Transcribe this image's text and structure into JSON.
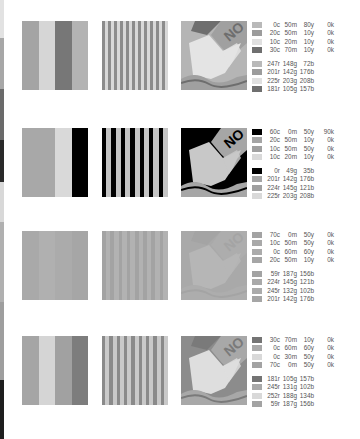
{
  "edge_strip": [
    {
      "top": 0,
      "height": 38,
      "color": "#e2e2e2"
    },
    {
      "top": 38,
      "height": 51,
      "color": "#a7a7a7"
    },
    {
      "top": 89,
      "height": 51,
      "color": "#6a6a6a"
    },
    {
      "top": 140,
      "height": 42,
      "color": "#2a2a2a"
    },
    {
      "top": 182,
      "height": 40,
      "color": "#d8d8d8"
    },
    {
      "top": 222,
      "height": 80,
      "color": "#b0b0b0"
    },
    {
      "top": 302,
      "height": 78,
      "color": "#9e9e9e"
    },
    {
      "top": 380,
      "height": 59,
      "color": "#1e1e1e"
    }
  ],
  "rows": [
    {
      "top": 21,
      "stripes": [
        "#a4a4a4",
        "#d6d6d6",
        "#777777",
        "#b3b3b3"
      ],
      "lines": {
        "a": "#8c8c8c",
        "b": "#d8d8d8",
        "count": 11
      },
      "art": {
        "bg": "#b5b5b5",
        "dark": "#6e6e6e",
        "light": "#e4e4e4",
        "mid": "#a0a0a0"
      },
      "swatches_cmyk": [
        "#b9b9b9",
        "#9c9c9c",
        "#e0e0e0",
        "#6f6f6f"
      ],
      "swatches_rgb": [
        "#b9b9b9",
        "#9c9c9c",
        "#e0e0e0",
        "#6f6f6f"
      ],
      "cmyk": [
        [
          "0c",
          "50m",
          "80y",
          "0k"
        ],
        [
          "20c",
          "50m",
          "10y",
          "0k"
        ],
        [
          "10c",
          "20m",
          "10y",
          "0k"
        ],
        [
          "30c",
          "70m",
          "10y",
          "0k"
        ]
      ],
      "rgb": [
        [
          "247r",
          "148g",
          "72b"
        ],
        [
          "201r",
          "142g",
          "176b"
        ],
        [
          "225r",
          "203g",
          "208b"
        ],
        [
          "181r",
          "105g",
          "157b"
        ]
      ]
    },
    {
      "top": 128,
      "stripes": [
        "#a8a8a8",
        "#a8a8a8",
        "#d9d9d9",
        "#000000"
      ],
      "lines": {
        "a": "#000000",
        "b": "#c4c4c4",
        "count": 7
      },
      "art": {
        "bg": "#000000",
        "dark": "#000000",
        "light": "#c8c8c8",
        "mid": "#a6a6a6"
      },
      "swatches_cmyk": [
        "#000000",
        "#a5a5a5",
        "#a0a0a0",
        "#d9d9d9"
      ],
      "swatches_rgb": [
        "#000000",
        "#a5a5a5",
        "#a0a0a0",
        "#d9d9d9"
      ],
      "cmyk": [
        [
          "60c",
          "0m",
          "50y",
          "90k"
        ],
        [
          "20c",
          "50m",
          "10y",
          "0k"
        ],
        [
          "10c",
          "50m",
          "50y",
          "0k"
        ],
        [
          "10c",
          "20m",
          "10y",
          "0k"
        ]
      ],
      "rgb": [
        [
          "0r",
          "49g",
          "35b"
        ],
        [
          "201r",
          "142g",
          "176b"
        ],
        [
          "224r",
          "145g",
          "121b"
        ],
        [
          "225r",
          "203g",
          "208b"
        ]
      ]
    },
    {
      "top": 231,
      "stripes": [
        "#a9a9a9",
        "#b0b0b0",
        "#ababab",
        "#a6a6a6"
      ],
      "lines": {
        "a": "#a3a3a3",
        "b": "#b2b2b2",
        "count": 8
      },
      "art": {
        "bg": "#a9a9a9",
        "dark": "#a4a4a4",
        "light": "#b6b6b6",
        "mid": "#adadad"
      },
      "swatches_cmyk": [
        "#a3a3a3",
        "#a9a9a9",
        "#ababab",
        "#a6a6a6"
      ],
      "swatches_rgb": [
        "#a3a3a3",
        "#a9a9a9",
        "#ababab",
        "#a6a6a6"
      ],
      "cmyk": [
        [
          "70c",
          "0m",
          "50y",
          "0k"
        ],
        [
          "10c",
          "50m",
          "50y",
          "0k"
        ],
        [
          "0c",
          "60m",
          "60y",
          "0k"
        ],
        [
          "20c",
          "50m",
          "10y",
          "0k"
        ]
      ],
      "rgb": [
        [
          "59r",
          "187g",
          "156b"
        ],
        [
          "224r",
          "145g",
          "121b"
        ],
        [
          "245r",
          "132g",
          "102b"
        ],
        [
          "201r",
          "142g",
          "176b"
        ]
      ]
    },
    {
      "top": 336,
      "stripes": [
        "#a5a5a5",
        "#d5d5d5",
        "#a1a1a1",
        "#7d7d7d"
      ],
      "lines": {
        "a": "#8a8a8a",
        "b": "#c9c9c9",
        "count": 9
      },
      "art": {
        "bg": "#8c8c8c",
        "dark": "#7a7a7a",
        "light": "#dedede",
        "mid": "#a8a8a8"
      },
      "swatches_cmyk": [
        "#747474",
        "#a9a9a9",
        "#d9d9d9",
        "#a3a3a3"
      ],
      "swatches_rgb": [
        "#747474",
        "#a9a9a9",
        "#d9d9d9",
        "#a3a3a3"
      ],
      "cmyk": [
        [
          "30c",
          "70m",
          "10y",
          "0k"
        ],
        [
          "0c",
          "60m",
          "60y",
          "0k"
        ],
        [
          "0c",
          "30m",
          "50y",
          "0k"
        ],
        [
          "70c",
          "0m",
          "50y",
          "0k"
        ]
      ],
      "rgb": [
        [
          "181r",
          "105g",
          "157b"
        ],
        [
          "245r",
          "131g",
          "102b"
        ],
        [
          "252r",
          "188g",
          "134b"
        ],
        [
          "59r",
          "187g",
          "156b"
        ]
      ]
    }
  ],
  "art_text": "NO"
}
